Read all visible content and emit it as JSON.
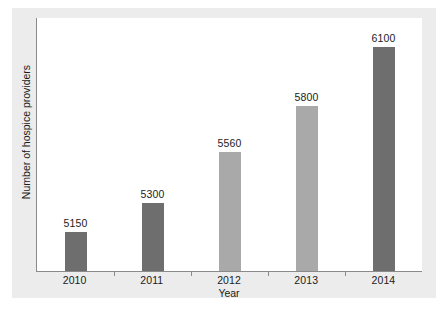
{
  "chart_data": {
    "type": "bar",
    "title": "",
    "subtitle": "",
    "xlabel": "Year",
    "ylabel": "Number of hospice providers",
    "categories": [
      "2010",
      "2011",
      "2012",
      "2013",
      "2014"
    ],
    "values": [
      5150,
      5300,
      5560,
      5800,
      6100
    ],
    "data_labels": [
      "5150",
      "5300",
      "5560",
      "5800",
      "6100"
    ],
    "bar_colors": [
      "#6e6e6e",
      "#6e6e6e",
      "#a9a9a9",
      "#a9a9a9",
      "#6e6e6e"
    ],
    "ylim": [
      4950,
      6250
    ],
    "y_tick_labels": [],
    "grid": false,
    "legend": false,
    "legend_position": "none",
    "axis_line_color": "#8a8a8a",
    "figure_background": "#ececec",
    "plot_background": "#ffffff"
  },
  "bars": [
    {
      "category": "2010",
      "value": 5150,
      "label": "5150",
      "tone": "dark"
    },
    {
      "category": "2011",
      "value": 5300,
      "label": "5300",
      "tone": "dark"
    },
    {
      "category": "2012",
      "value": 5560,
      "label": "5560",
      "tone": "light"
    },
    {
      "category": "2013",
      "value": 5800,
      "label": "5800",
      "tone": "light"
    },
    {
      "category": "2014",
      "value": 6100,
      "label": "6100",
      "tone": "dark"
    }
  ]
}
